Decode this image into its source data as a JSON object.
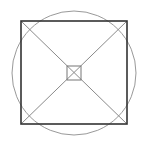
{
  "diagram": {
    "width": 148,
    "height": 146,
    "colors": {
      "outer_square": "#333333",
      "circle": "#999999",
      "diagonals": "#8a8a8a",
      "inner_square": "#777777"
    },
    "circle": {
      "cx": 74,
      "cy": 73,
      "r": 62
    },
    "outer_square": {
      "x": 21,
      "y": 21,
      "w": 106,
      "h": 103
    },
    "inner_square": {
      "x": 67,
      "y": 66,
      "w": 14,
      "h": 14
    }
  }
}
